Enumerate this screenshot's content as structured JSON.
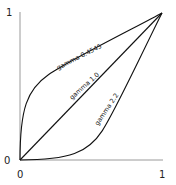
{
  "chart_data": {
    "type": "line",
    "title": "",
    "xlabel": "",
    "ylabel": "",
    "xlim": [
      0,
      1
    ],
    "ylim": [
      0,
      1
    ],
    "x_ticks": [
      "0",
      "1"
    ],
    "y_ticks": [
      "0",
      "1"
    ],
    "grid": false,
    "series": [
      {
        "name": "gamma 0.4545",
        "gamma": 0.4545,
        "label": "gamma 0.4545"
      },
      {
        "name": "gamma 1.0",
        "gamma": 1.0,
        "label": "gamma 1.0"
      },
      {
        "name": "gamma 2.2",
        "gamma": 2.2,
        "label": "gamma 2.2"
      }
    ]
  }
}
